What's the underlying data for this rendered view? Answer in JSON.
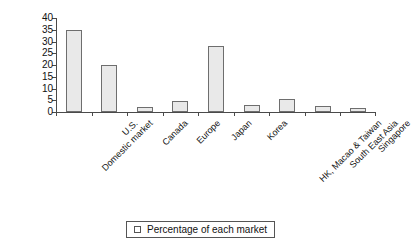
{
  "chart_data": {
    "type": "bar",
    "title": "",
    "xlabel": "",
    "ylabel": "",
    "ylim": [
      0,
      40
    ],
    "yticks": [
      0,
      5,
      10,
      15,
      20,
      25,
      30,
      35,
      40
    ],
    "grid": false,
    "legend_position": "bottom",
    "categories": [
      "Domestic market",
      "U.S.",
      "Canada",
      "Europe",
      "Japan",
      "Korea",
      "HK, Macao & Taiwan",
      "South East Asia",
      "Singapore"
    ],
    "series": [
      {
        "name": "Percentage of each market",
        "values": [
          35,
          20,
          2,
          4.5,
          28,
          3,
          5.5,
          2.5,
          1.5
        ]
      }
    ]
  },
  "legend": {
    "marker": "hollow-square",
    "label": "Percentage of each market"
  },
  "colors": {
    "bar_fill": "#e9e9e9",
    "bar_border": "#6e6e6e",
    "axis": "#4a4a4a",
    "text": "#111111",
    "background": "#ffffff"
  }
}
